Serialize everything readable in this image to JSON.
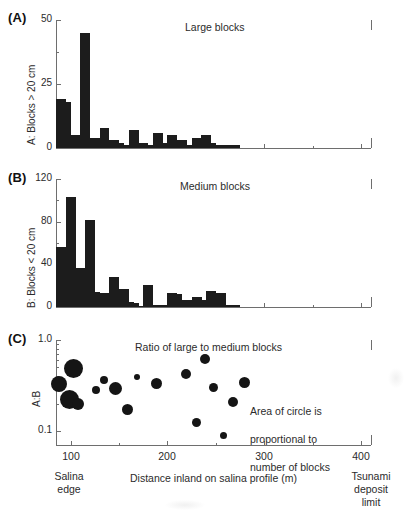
{
  "figure": {
    "x_axis": {
      "label": "Distance inland on salina profile (m)",
      "min": 85,
      "max": 410,
      "ticks": [
        100,
        200,
        300,
        400
      ],
      "tick_labels": [
        "100",
        "200",
        "300",
        "400"
      ],
      "minor_ticks": [
        150,
        250,
        350
      ],
      "left_note": "Salina\nedge",
      "left_note_line1": "Salina",
      "left_note_line2": "edge",
      "right_note_line1": "Tsunami",
      "right_note_line2": "deposit",
      "right_note_line3": "limit"
    },
    "annotation": {
      "area_note_line1": "Area of circle is",
      "area_note_line2": "proportional to",
      "area_note_line3": "number of blocks"
    },
    "colors": {
      "bar_fill": "#1c1c1c",
      "dot_fill": "#151515",
      "axis": "#6e6e6e",
      "text": "#2b2b2b"
    }
  },
  "panels": [
    {
      "letter": "(A)",
      "title": "Large blocks",
      "ylabel": "A: Blocks > 20 cm"
    },
    {
      "letter": "(B)",
      "title": "Medium blocks",
      "ylabel": "B: Blocks < 20 cm"
    },
    {
      "letter": "(C)",
      "title": "Ratio of large to medium blocks",
      "ylabel": "A:B"
    }
  ],
  "chart_data": [
    {
      "type": "bar",
      "panel": "A",
      "title": "Large blocks",
      "xlabel": "Distance inland on salina profile (m)",
      "ylabel": "A: Blocks > 20 cm",
      "xlim": [
        85,
        410
      ],
      "ylim": [
        0,
        50
      ],
      "yticks": [
        0,
        25,
        50
      ],
      "ytick_labels": [
        "0",
        "25",
        "50"
      ],
      "grid": false,
      "bin_width": 5,
      "x": [
        85,
        90,
        95,
        100,
        105,
        110,
        115,
        120,
        125,
        130,
        135,
        140,
        145,
        150,
        155,
        160,
        165,
        170,
        175,
        180,
        185,
        190,
        195,
        200,
        205,
        210,
        215,
        220,
        225,
        230,
        235,
        240,
        245,
        250,
        255,
        260,
        265,
        270
      ],
      "values": [
        19,
        19,
        18,
        5,
        5,
        45,
        45,
        4,
        4,
        8,
        8,
        3,
        3,
        2,
        1,
        7,
        7,
        2,
        2,
        1,
        6,
        6,
        2,
        5,
        5,
        3,
        3,
        1,
        4,
        4,
        5,
        5,
        2,
        1,
        1,
        1,
        1,
        1
      ]
    },
    {
      "type": "bar",
      "panel": "B",
      "title": "Medium blocks",
      "xlabel": "Distance inland on salina profile (m)",
      "ylabel": "B: Blocks < 20 cm",
      "xlim": [
        85,
        410
      ],
      "ylim": [
        0,
        120
      ],
      "yticks": [
        0,
        40,
        80,
        120
      ],
      "ytick_labels": [
        "0",
        "40",
        "80",
        "120"
      ],
      "grid": false,
      "bin_width": 5,
      "x": [
        85,
        90,
        95,
        100,
        105,
        110,
        115,
        120,
        125,
        130,
        135,
        140,
        145,
        150,
        155,
        160,
        165,
        170,
        175,
        180,
        185,
        190,
        195,
        200,
        205,
        210,
        215,
        220,
        225,
        230,
        235,
        240,
        245,
        250,
        255,
        260,
        265,
        270
      ],
      "values": [
        56,
        56,
        103,
        103,
        37,
        37,
        82,
        82,
        14,
        13,
        13,
        28,
        28,
        17,
        17,
        5,
        4,
        1,
        21,
        21,
        2,
        2,
        2,
        13,
        13,
        12,
        7,
        7,
        9,
        9,
        7,
        15,
        15,
        13,
        13,
        2,
        2,
        2
      ]
    },
    {
      "type": "scatter",
      "panel": "C",
      "title": "Ratio of large to medium blocks",
      "xlabel": "Distance inland on salina profile (m)",
      "ylabel": "A:B",
      "xlim": [
        85,
        410
      ],
      "ylim": [
        0.07,
        1.0
      ],
      "yscale": "log",
      "yticks": [
        0.1,
        1.0
      ],
      "ytick_labels": [
        "0.1",
        "1.0"
      ],
      "grid": false,
      "size_note": "Area of circle is proportional to number of blocks",
      "points": [
        {
          "x": 88,
          "y": 0.33,
          "r": 8.0
        },
        {
          "x": 103,
          "y": 0.49,
          "r": 9.5
        },
        {
          "x": 99,
          "y": 0.22,
          "r": 9.5
        },
        {
          "x": 108,
          "y": 0.2,
          "r": 6.0
        },
        {
          "x": 126,
          "y": 0.28,
          "r": 4.0
        },
        {
          "x": 135,
          "y": 0.36,
          "r": 4.0
        },
        {
          "x": 146,
          "y": 0.29,
          "r": 6.5
        },
        {
          "x": 159,
          "y": 0.17,
          "r": 5.5
        },
        {
          "x": 169,
          "y": 0.39,
          "r": 3.0
        },
        {
          "x": 189,
          "y": 0.33,
          "r": 5.5
        },
        {
          "x": 219,
          "y": 0.42,
          "r": 5.0
        },
        {
          "x": 230,
          "y": 0.125,
          "r": 4.5
        },
        {
          "x": 239,
          "y": 0.62,
          "r": 5.0
        },
        {
          "x": 248,
          "y": 0.3,
          "r": 4.5
        },
        {
          "x": 258,
          "y": 0.088,
          "r": 3.5
        },
        {
          "x": 268,
          "y": 0.21,
          "r": 5.0
        },
        {
          "x": 279,
          "y": 0.34,
          "r": 5.5
        }
      ]
    }
  ]
}
